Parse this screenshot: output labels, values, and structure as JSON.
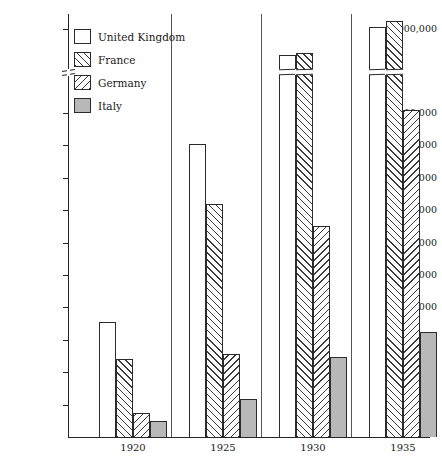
{
  "chart_data": {
    "type": "bar",
    "title": "",
    "xlabel": "",
    "ylabel": "",
    "categories": [
      "1920",
      "1925",
      "1930",
      "1935"
    ],
    "series": [
      {
        "name": "United Kingdom",
        "pattern": "empty",
        "values": [
          355000,
          905000,
          1330000,
          1980000
        ]
      },
      {
        "name": "France",
        "pattern": "hatch-up",
        "values": [
          240000,
          720000,
          1360000,
          2120000
        ]
      },
      {
        "name": "Germany",
        "pattern": "hatch-down",
        "values": [
          75000,
          255000,
          650000,
          1010000
        ]
      },
      {
        "name": "Italy",
        "pattern": "solid-gray",
        "values": [
          50000,
          118000,
          248000,
          325000
        ]
      }
    ],
    "ylim": [
      0,
      2000000
    ],
    "y_axis_break": {
      "present": true,
      "between": [
        1000000,
        2000000
      ]
    },
    "y_ticks": [
      {
        "value": 100000,
        "label": "100,000"
      },
      {
        "value": 200000,
        "label": "200,000"
      },
      {
        "value": 300000,
        "label": "300,000"
      },
      {
        "value": 400000,
        "label": "400,000"
      },
      {
        "value": 500000,
        "label": "500,000"
      },
      {
        "value": 600000,
        "label": "600,000"
      },
      {
        "value": 700000,
        "label": "700,000"
      },
      {
        "value": 800000,
        "label": "800,000"
      },
      {
        "value": 900000,
        "label": "900,000"
      },
      {
        "value": 1000000,
        "label": "1,000,000"
      },
      {
        "value": 2000000,
        "label": "2,000,000"
      }
    ],
    "grid": false,
    "legend_position": "top-left"
  },
  "legend": {
    "items": [
      {
        "label": "United Kingdom"
      },
      {
        "label": "France"
      },
      {
        "label": "Germany"
      },
      {
        "label": "Italy"
      }
    ]
  },
  "colors": {
    "axis": "#262626",
    "bar_outline": "#2b2b2b",
    "hatch": "#3a3a3a",
    "italy_fill": "#b8b8b8",
    "background": "#ffffff"
  }
}
